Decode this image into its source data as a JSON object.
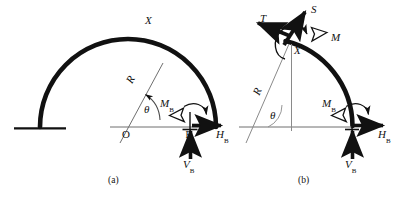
{
  "figure": {
    "background_color": "#ffffff",
    "line_color": "#111111",
    "thin_line_color": "#8a8a8a",
    "panels": [
      {
        "id": "a",
        "caption": "(a)",
        "description": "Full semicircular arch fixed at left base with reactions at right support B",
        "labels": {
          "section_x": "X",
          "radius": "R",
          "angle": "θ",
          "origin": "O",
          "support": "B",
          "moment_b": "M",
          "moment_b_sub": "B",
          "horizontal_reaction": "H",
          "horizontal_reaction_sub": "B",
          "vertical_reaction": "V",
          "vertical_reaction_sub": "B"
        }
      },
      {
        "id": "b",
        "caption": "(b)",
        "description": "Cut segment of arch from section X to support B showing internal forces T, S, M and reactions",
        "labels": {
          "section_x": "X",
          "radius": "R",
          "angle": "θ",
          "tangential_force": "T",
          "shear_force": "S",
          "internal_moment": "M",
          "moment_b": "M",
          "moment_b_sub": "B",
          "horizontal_reaction": "H",
          "horizontal_reaction_sub": "B",
          "vertical_reaction": "V",
          "vertical_reaction_sub": "B"
        }
      }
    ]
  }
}
